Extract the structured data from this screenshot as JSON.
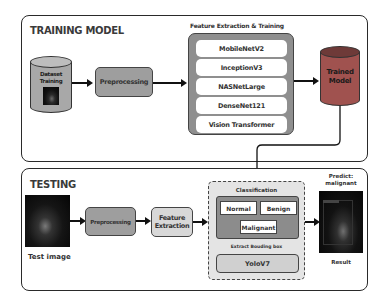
{
  "training": {
    "title": "TRAINING MODEL",
    "dataset": {
      "line1": "Dataset",
      "line2": "Training"
    },
    "preprocessing": "Preprocessing",
    "feature_extraction_title": "Feature Extraction & Training",
    "models": [
      "MobileNetV2",
      "InceptionV3",
      "NASNetLarge",
      "DenseNet121",
      "Vision Transformer"
    ],
    "trained_model": {
      "line1": "Trained",
      "line2": "Model"
    }
  },
  "testing": {
    "title": "TESTING",
    "test_image_label": "Test image",
    "preprocessing": "Preprocessing",
    "feature_extraction": {
      "line1": "Feature",
      "line2": "Extraction"
    },
    "classification_title": "Classification",
    "classes": [
      "Normal",
      "Benign",
      "Malignant"
    ],
    "bbox_title": "Extract Bouding box",
    "detector": "YoloV7",
    "predict": {
      "line1": "Predict:",
      "line2": "malignant"
    },
    "result_label": "Result"
  },
  "colors": {
    "preprocessing_fill": "#9e9e9e",
    "feature_container_fill": "#8f8f8f",
    "trained_model_fill": "#a0524f",
    "dataset_fill": "#a8a8a8",
    "classification_fill": "#8c8c8c",
    "light_box_fill": "#d8d8d8"
  }
}
